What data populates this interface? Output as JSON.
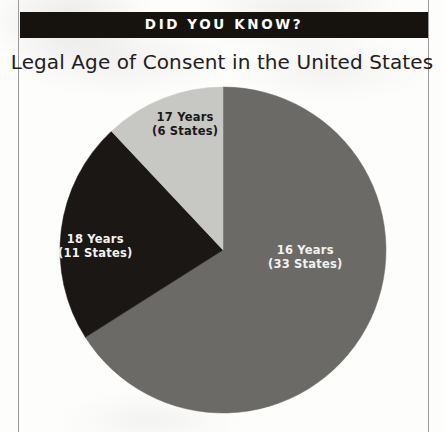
{
  "banner": {
    "text": "DID YOU KNOW?"
  },
  "headline": "Legal Age of Consent in the United States",
  "chart_data": {
    "type": "pie",
    "title": "Legal Age of Consent in the United States",
    "unit": "States",
    "total": 50,
    "start_angle_deg": 0,
    "direction": "clockwise",
    "legend": "none (slices labeled in place)",
    "categories": [
      "16 Years",
      "18 Years",
      "17 Years"
    ],
    "values": [
      33,
      11,
      6
    ],
    "slices": [
      {
        "category": "16 Years",
        "value": 33,
        "value_label": "(33 States)",
        "percent": 66.0,
        "angle_deg": 237.6,
        "color": "#6b6a67",
        "label_color": "#f2f2f0",
        "label_line1": "16 Years",
        "label_line2": "(33 States)"
      },
      {
        "category": "18 Years",
        "value": 11,
        "value_label": "(11 States)",
        "percent": 22.0,
        "angle_deg": 79.2,
        "color": "#1b1714",
        "label_color": "#f2f2f0",
        "label_line1": "18 Years",
        "label_line2": "(11 States)"
      },
      {
        "category": "17 Years",
        "value": 6,
        "value_label": "(6 States)",
        "percent": 12.0,
        "angle_deg": 43.2,
        "color": "#c7c7c3",
        "label_color": "#1b1917",
        "label_line1": "17 Years",
        "label_line2": "(6 States)"
      }
    ]
  },
  "geometry": {
    "center_x": 223,
    "center_y": 250,
    "radius": 163
  },
  "colors": {
    "banner_background": "#16130f",
    "banner_text": "#ffffff",
    "page_background": "#fdfdfc",
    "rule": "#9a9a9a",
    "headline_text": "#222020"
  }
}
